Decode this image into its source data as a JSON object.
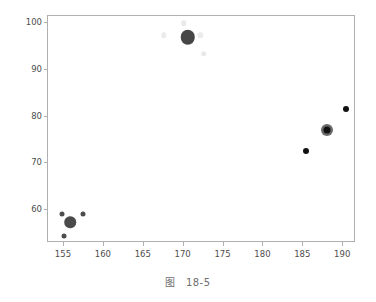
{
  "figure": {
    "caption_prefix": "图",
    "caption_number": "18-5",
    "background_color": "#ffffff",
    "frame_color": "#b0b0b0",
    "tick_label_color": "#4d4d4d",
    "caption_color": "#6e6e6e"
  },
  "chart_data": {
    "type": "scatter",
    "title": "",
    "xlabel": "",
    "ylabel": "",
    "xlim": [
      153.0,
      191.6
    ],
    "ylim": [
      53.0,
      101.5
    ],
    "xticks": [
      155,
      160,
      165,
      170,
      175,
      180,
      185,
      190
    ],
    "yticks": [
      60,
      70,
      80,
      90,
      100
    ],
    "xtick_labels": [
      "155",
      "160",
      "165",
      "170",
      "175",
      "180",
      "185",
      "190"
    ],
    "ytick_labels": [
      "60",
      "70",
      "80",
      "90",
      "100"
    ],
    "grid": false,
    "legend": null,
    "series": [
      {
        "name": "cluster-lower-left",
        "color": "#4d4d4d",
        "points": [
          {
            "x": 154.8,
            "y": 59.2,
            "size": 5.0,
            "color": "#4d4d4d",
            "opacity": 1.0
          },
          {
            "x": 155.8,
            "y": 57.4,
            "size": 11.5,
            "color": "#4a4a4a",
            "opacity": 1.0
          },
          {
            "x": 157.4,
            "y": 59.1,
            "size": 5.0,
            "color": "#4d4d4d",
            "opacity": 1.0
          },
          {
            "x": 155.0,
            "y": 54.5,
            "size": 5.0,
            "color": "#4d4d4d",
            "opacity": 1.0
          }
        ]
      },
      {
        "name": "cluster-top-center",
        "color": "#3f3f3f",
        "points": [
          {
            "x": 170.5,
            "y": 97.0,
            "size": 14.5,
            "color": "#464646",
            "opacity": 1.0
          },
          {
            "x": 170.0,
            "y": 100.0,
            "size": 5.5,
            "color": "#9a9a9a",
            "opacity": 0.22
          },
          {
            "x": 167.5,
            "y": 97.4,
            "size": 5.5,
            "color": "#9a9a9a",
            "opacity": 0.2
          },
          {
            "x": 172.1,
            "y": 97.4,
            "size": 5.5,
            "color": "#9a9a9a",
            "opacity": 0.2
          },
          {
            "x": 172.5,
            "y": 93.4,
            "size": 5.5,
            "color": "#9a9a9a",
            "opacity": 0.22
          }
        ]
      },
      {
        "name": "cluster-right",
        "color": "#111111",
        "points": [
          {
            "x": 185.3,
            "y": 72.7,
            "size": 6.0,
            "color": "#111111",
            "opacity": 1.0
          },
          {
            "x": 188.0,
            "y": 77.2,
            "size": 12.0,
            "color": "#6a6a6a",
            "opacity": 1.0
          },
          {
            "x": 188.0,
            "y": 77.2,
            "size": 7.0,
            "color": "#111111",
            "opacity": 1.0
          },
          {
            "x": 190.4,
            "y": 81.7,
            "size": 6.0,
            "color": "#111111",
            "opacity": 1.0
          }
        ]
      }
    ]
  }
}
